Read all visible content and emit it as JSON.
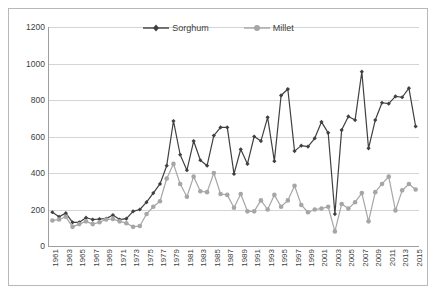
{
  "chart_data": {
    "type": "line",
    "title": "",
    "xlabel": "",
    "ylabel": "",
    "ylim": [
      0,
      1200
    ],
    "ytick_step": 200,
    "yticks": [
      0,
      200,
      400,
      600,
      800,
      1000,
      1200
    ],
    "grid": "horizontal",
    "legend_position": "top-center-inside",
    "x": [
      1961,
      1962,
      1963,
      1964,
      1965,
      1966,
      1967,
      1968,
      1969,
      1970,
      1971,
      1972,
      1973,
      1974,
      1975,
      1976,
      1977,
      1978,
      1979,
      1980,
      1981,
      1982,
      1983,
      1984,
      1985,
      1986,
      1987,
      1988,
      1989,
      1990,
      1991,
      1992,
      1993,
      1994,
      1995,
      1996,
      1997,
      1998,
      1999,
      2000,
      2001,
      2002,
      2003,
      2004,
      2005,
      2006,
      2007,
      2008,
      2009,
      2010,
      2011,
      2012,
      2013,
      2014,
      2015
    ],
    "xtick_labels": [
      1961,
      1963,
      1965,
      1967,
      1969,
      1971,
      1973,
      1975,
      1977,
      1979,
      1981,
      1983,
      1985,
      1987,
      1989,
      1991,
      1993,
      1995,
      1997,
      1999,
      2001,
      2003,
      2005,
      2007,
      2009,
      2011,
      2013,
      2015
    ],
    "series": [
      {
        "name": "Sorghum",
        "color": "#404040",
        "marker": "diamond",
        "values": [
          185,
          160,
          180,
          130,
          130,
          155,
          145,
          148,
          150,
          170,
          145,
          150,
          190,
          200,
          240,
          290,
          340,
          440,
          685,
          500,
          415,
          575,
          470,
          440,
          605,
          650,
          650,
          395,
          530,
          450,
          600,
          575,
          705,
          465,
          825,
          860,
          520,
          550,
          545,
          590,
          680,
          620,
          175,
          635,
          710,
          690,
          955,
          535,
          690,
          785,
          780,
          820,
          815,
          865,
          655
        ]
      },
      {
        "name": "Millet",
        "color": "#a6a6a6",
        "marker": "circle",
        "values": [
          140,
          145,
          160,
          105,
          120,
          135,
          120,
          130,
          145,
          148,
          135,
          125,
          105,
          110,
          175,
          215,
          245,
          370,
          450,
          340,
          270,
          380,
          300,
          295,
          400,
          285,
          280,
          210,
          285,
          190,
          190,
          250,
          200,
          280,
          215,
          250,
          330,
          225,
          185,
          200,
          205,
          215,
          80,
          230,
          205,
          240,
          290,
          135,
          295,
          340,
          380,
          195,
          305,
          340,
          310
        ]
      }
    ]
  },
  "legend": {
    "items": [
      {
        "label": "Sorghum"
      },
      {
        "label": "Millet"
      }
    ]
  }
}
